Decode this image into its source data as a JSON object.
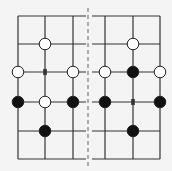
{
  "diagram": {
    "background": "#f4f4f4",
    "line_color": "#333333",
    "divider_color": "#888888",
    "rows_y": [
      16,
      44,
      72,
      102,
      131,
      159
    ],
    "divider_x": 88,
    "left_board": {
      "cols_x": [
        18,
        45,
        73
      ],
      "h_extent": [
        18,
        86
      ],
      "stones": [
        {
          "col": 1,
          "row": 1,
          "color": "white"
        },
        {
          "col": 0,
          "row": 2,
          "color": "white"
        },
        {
          "col": 2,
          "row": 2,
          "color": "white"
        },
        {
          "col": 0,
          "row": 3,
          "color": "black"
        },
        {
          "col": 1,
          "row": 3,
          "color": "white"
        },
        {
          "col": 2,
          "row": 3,
          "color": "black"
        },
        {
          "col": 1,
          "row": 4,
          "color": "black"
        }
      ],
      "markers": [
        {
          "col": 1,
          "row": 2,
          "symbol": "x"
        }
      ]
    },
    "right_board": {
      "cols_x": [
        105,
        133,
        160
      ],
      "h_extent": [
        92,
        160
      ],
      "stones": [
        {
          "col": 1,
          "row": 1,
          "color": "white"
        },
        {
          "col": 0,
          "row": 2,
          "color": "white"
        },
        {
          "col": 1,
          "row": 2,
          "color": "black"
        },
        {
          "col": 2,
          "row": 2,
          "color": "white"
        },
        {
          "col": 0,
          "row": 3,
          "color": "black"
        },
        {
          "col": 2,
          "row": 3,
          "color": "black"
        },
        {
          "col": 1,
          "row": 4,
          "color": "black"
        }
      ],
      "markers": [
        {
          "col": 1,
          "row": 3,
          "symbol": "x"
        }
      ]
    }
  }
}
